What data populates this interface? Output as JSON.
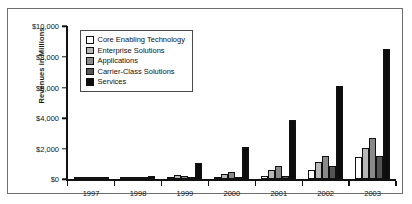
{
  "chart_data": {
    "type": "bar",
    "title": "",
    "subtitle": "",
    "xlabel": "",
    "ylabel": "Revenues in Millions",
    "categories": [
      "1997",
      "1998",
      "1999",
      "2000",
      "2001",
      "2002",
      "2003"
    ],
    "ylim": [
      0,
      10000
    ],
    "yticks": [
      0,
      2000,
      4000,
      6000,
      8000,
      10000
    ],
    "ytick_labels": [
      "$0",
      "$2,000",
      "$4,000",
      "$6,000",
      "$8,000",
      "$10,000"
    ],
    "grid": false,
    "legend_position": "upper-left-inside",
    "series": [
      {
        "name": "Core Enabling Technology",
        "color": "#ffffff",
        "values": [
          10,
          60,
          130,
          180,
          230,
          600,
          1450
        ]
      },
      {
        "name": "Enterprise Solutions",
        "color": "#b7b7b7",
        "values": [
          15,
          170,
          260,
          350,
          640,
          1150,
          2050
        ]
      },
      {
        "name": "Applications",
        "color": "#8a8a8a",
        "values": [
          15,
          150,
          200,
          480,
          900,
          1500,
          2700
        ]
      },
      {
        "name": "Carrier-Class Solutions",
        "color": "#555555",
        "values": [
          10,
          90,
          110,
          180,
          230,
          850,
          1550
        ]
      },
      {
        "name": "Services",
        "color": "#0d0d0d",
        "values": [
          20,
          240,
          1100,
          2100,
          3900,
          6100,
          8500
        ]
      }
    ]
  },
  "legend": {
    "items": [
      {
        "label": "Core Enabling Technology"
      },
      {
        "label": "Enterprise Solutions"
      },
      {
        "label": "Applications"
      },
      {
        "label": "Carrier-Class Solutions"
      },
      {
        "label": "Services"
      }
    ]
  }
}
